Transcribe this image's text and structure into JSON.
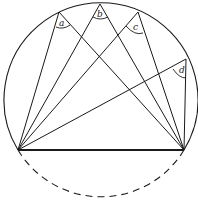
{
  "diagram": {
    "stroke_color": "#1a1a1a",
    "background": "#ffffff",
    "circle": {
      "cx": 100,
      "cy": 103,
      "r": 97
    },
    "chord": {
      "x1": 18,
      "y1": 150,
      "x2": 184,
      "y2": 150,
      "style": "solid-thick"
    },
    "lower_arc": {
      "style": "dashed"
    },
    "endpoints": {
      "left": [
        18,
        150
      ],
      "right": [
        184,
        150
      ]
    },
    "vertices": [
      {
        "label": "a",
        "x": 59,
        "y": 12
      },
      {
        "label": "b",
        "x": 100,
        "y": 4
      },
      {
        "label": "c",
        "x": 138,
        "y": 12
      },
      {
        "label": "d",
        "x": 186,
        "y": 59
      }
    ],
    "labels": {
      "a": "a",
      "b": "b",
      "c": "c",
      "d": "d"
    }
  }
}
